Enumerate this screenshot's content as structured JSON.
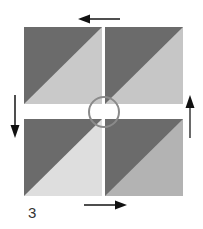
{
  "figure": {
    "label": "3",
    "squares": [
      {
        "id": "top-left",
        "dark": "#6b6b6b",
        "light": "#c9c9c9"
      },
      {
        "id": "top-right",
        "dark": "#6b6b6b",
        "light": "#c6c6c6"
      },
      {
        "id": "bottom-left",
        "dark": "#6b6b6b",
        "light": "#dedede"
      },
      {
        "id": "bottom-right",
        "dark": "#6b6b6b",
        "light": "#b3b3b3"
      }
    ],
    "arrows": [
      {
        "position": "top",
        "direction": "left"
      },
      {
        "position": "left",
        "direction": "down"
      },
      {
        "position": "bottom",
        "direction": "right"
      },
      {
        "position": "right",
        "direction": "up"
      }
    ],
    "center_marker": "circle"
  }
}
